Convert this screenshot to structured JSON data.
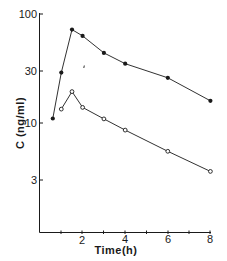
{
  "chart_data": {
    "type": "line",
    "title": "",
    "xlabel": "Time(h)",
    "ylabel": "C (ng/ml)",
    "yscale": "log",
    "xlim": [
      0,
      8
    ],
    "ylim": [
      1,
      100
    ],
    "x_ticks_labeled": [
      2,
      4,
      6,
      8
    ],
    "x_ticks_minor": [
      1,
      3,
      5,
      7
    ],
    "y_ticks": [
      {
        "value": 100,
        "label": "100"
      },
      {
        "value": 30,
        "label": "30"
      },
      {
        "value": 10,
        "label": "10"
      },
      {
        "value": 3,
        "label": "3"
      }
    ],
    "grid": false,
    "legend": null,
    "series": [
      {
        "name": "filled circles",
        "marker": "filled-circle",
        "x": [
          0.6,
          1.0,
          1.5,
          2.0,
          3.0,
          4.0,
          6.0,
          8.0
        ],
        "values": [
          11,
          29,
          72,
          63,
          44,
          35,
          26,
          16
        ]
      },
      {
        "name": "open circles",
        "marker": "open-circle",
        "x": [
          1.0,
          1.5,
          2.0,
          3.0,
          4.0,
          6.0,
          8.0
        ],
        "values": [
          13.4,
          19.4,
          13.9,
          10.9,
          8.6,
          5.5,
          3.6
        ]
      }
    ]
  },
  "labels": {
    "xlabel": "Time(h)",
    "ylabel": "C (ng/ml)",
    "x2": "2",
    "x4": "4",
    "x6": "6",
    "x8": "8",
    "y100": "100",
    "y30": "30",
    "y10": "10",
    "y3": "3"
  },
  "colors": {
    "ink": "#1a1a1a",
    "background": "#ffffff"
  }
}
